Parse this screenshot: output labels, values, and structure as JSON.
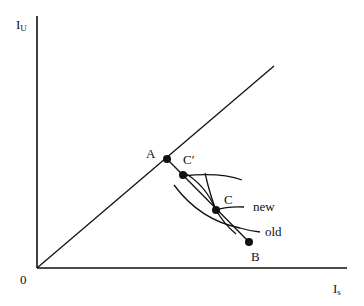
{
  "diagram": {
    "axes": {
      "y_label_main": "I",
      "y_label_sub": "U",
      "x_label_main": "I",
      "x_label_sub": "s",
      "origin_label": "0"
    },
    "points": {
      "A": "A",
      "C_prime": "C′",
      "C": "C",
      "B": "B"
    },
    "curves": {
      "new": "new",
      "old": "old"
    },
    "colors": {
      "line": "#111111",
      "background": "#ffffff"
    }
  }
}
